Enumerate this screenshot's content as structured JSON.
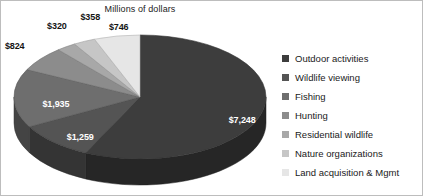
{
  "chart": {
    "title": "Millions of dollars"
  },
  "chart_data": {
    "type": "pie",
    "title": "Millions of dollars",
    "subtitle": "",
    "xlabel": "",
    "ylabel": "",
    "unit": "Millions of dollars",
    "three_d": true,
    "legend_position": "right",
    "grid": false,
    "total": 13690,
    "categories": [
      "Outdoor activities",
      "Wildlife viewing",
      "Fishing",
      "Hunting",
      "Residential wildlife",
      "Nature organizations",
      "Land acquisition & Mgmt"
    ],
    "values": [
      7248,
      1259,
      1935,
      824,
      320,
      358,
      746
    ],
    "data_labels": [
      "$7,248",
      "$1,259",
      "$1,935",
      "$824",
      "$320",
      "$358",
      "$746"
    ],
    "colors": [
      "#3d3d3d",
      "#545454",
      "#6e6e6e",
      "#8c8c8c",
      "#a8a8a8",
      "#c6c6c6",
      "#e6e6e6"
    ],
    "slices": [
      {
        "label": "Outdoor activities",
        "value": 7248,
        "data_label": "$7,248",
        "color": "#3d3d3d",
        "percent": 52.9,
        "label_placement": "inside"
      },
      {
        "label": "Wildlife viewing",
        "value": 1259,
        "data_label": "$1,259",
        "color": "#545454",
        "percent": 9.2,
        "label_placement": "inside"
      },
      {
        "label": "Fishing",
        "value": 1935,
        "data_label": "$1,935",
        "color": "#6e6e6e",
        "percent": 14.1,
        "label_placement": "inside"
      },
      {
        "label": "Hunting",
        "value": 824,
        "data_label": "$824",
        "color": "#8c8c8c",
        "percent": 6.0,
        "label_placement": "outside"
      },
      {
        "label": "Residential wildlife",
        "value": 320,
        "data_label": "$320",
        "color": "#a8a8a8",
        "percent": 2.3,
        "label_placement": "outside"
      },
      {
        "label": "Nature organizations",
        "value": 358,
        "data_label": "$358",
        "color": "#c6c6c6",
        "percent": 2.6,
        "label_placement": "outside"
      },
      {
        "label": "Land acquisition & Mgmt",
        "value": 746,
        "data_label": "$746",
        "color": "#e6e6e6",
        "percent": 5.4,
        "label_placement": "outside"
      }
    ]
  },
  "legend": {
    "items": [
      {
        "label": "Outdoor activities",
        "color": "#3d3d3d"
      },
      {
        "label": "Wildlife viewing",
        "color": "#545454"
      },
      {
        "label": "Fishing",
        "color": "#6e6e6e"
      },
      {
        "label": "Hunting",
        "color": "#8c8c8c"
      },
      {
        "label": "Residential wildlife",
        "color": "#a8a8a8"
      },
      {
        "label": "Nature organizations",
        "color": "#c6c6c6"
      },
      {
        "label": "Land acquisition & Mgmt",
        "color": "#e6e6e6"
      }
    ]
  }
}
